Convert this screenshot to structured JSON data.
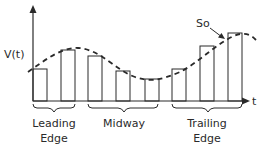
{
  "diagram": {
    "y_axis_label": "V(t)",
    "x_axis_label": "t",
    "annotation": "So",
    "groups": [
      {
        "line1": "Leading",
        "line2": "Edge"
      },
      {
        "line1": "Midway",
        "line2": ""
      },
      {
        "line1": "Trailing",
        "line2": "Edge"
      }
    ],
    "bars": [
      {
        "x": 33,
        "w": 14,
        "top": 69
      },
      {
        "x": 61,
        "w": 14,
        "top": 50
      },
      {
        "x": 88,
        "w": 14,
        "top": 56
      },
      {
        "x": 116,
        "w": 14,
        "top": 71
      },
      {
        "x": 145,
        "w": 14,
        "top": 79
      },
      {
        "x": 172,
        "w": 14,
        "top": 69
      },
      {
        "x": 200,
        "w": 14,
        "top": 46
      },
      {
        "x": 228,
        "w": 14,
        "top": 33
      }
    ],
    "colors": {
      "line": "#2a2a2a",
      "background": "#ffffff"
    }
  }
}
